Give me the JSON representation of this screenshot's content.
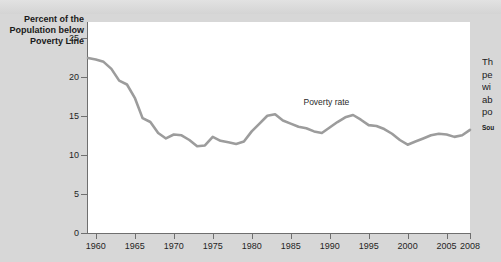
{
  "figure": {
    "y_axis_title": "Percent of the Population below Poverty Line",
    "series_annotation": "Poverty rate",
    "line_color": "#9c9c9c",
    "panel_color": "#ffffff",
    "background_color": "#d7d7d7"
  },
  "side_text": {
    "lines": [
      "Th",
      "pe",
      "wi",
      "ab",
      "po"
    ],
    "source_label": "Sou"
  },
  "chart_data": {
    "type": "line",
    "title": "",
    "xlabel": "",
    "ylabel": "Percent of the Population below Poverty Line",
    "xlim": [
      1959,
      2008
    ],
    "ylim": [
      0,
      27
    ],
    "grid": false,
    "legend": "none",
    "annotations": [
      {
        "text": "Poverty rate",
        "x": 1991,
        "y": 16.8
      }
    ],
    "ytick_labels": [
      "0",
      "5",
      "10",
      "15",
      "20",
      "25"
    ],
    "yticks": [
      0,
      5,
      10,
      15,
      20,
      25
    ],
    "xtick_labels": [
      "1960",
      "1965",
      "1970",
      "1975",
      "1980",
      "1985",
      "1990",
      "1995",
      "2000",
      "2005",
      "2008"
    ],
    "xticks": [
      1960,
      1965,
      1970,
      1975,
      1980,
      1985,
      1990,
      1995,
      2000,
      2005,
      2008
    ],
    "series": [
      {
        "name": "Poverty rate",
        "x": [
          1959,
          1960,
          1961,
          1962,
          1963,
          1964,
          1965,
          1966,
          1967,
          1968,
          1969,
          1970,
          1971,
          1972,
          1973,
          1974,
          1975,
          1976,
          1977,
          1978,
          1979,
          1980,
          1981,
          1982,
          1983,
          1984,
          1985,
          1986,
          1987,
          1988,
          1989,
          1990,
          1991,
          1992,
          1993,
          1994,
          1995,
          1996,
          1997,
          1998,
          1999,
          2000,
          2001,
          2002,
          2003,
          2004,
          2005,
          2006,
          2007,
          2008
        ],
        "values": [
          22.4,
          22.2,
          21.9,
          21.0,
          19.5,
          19.0,
          17.3,
          14.7,
          14.2,
          12.8,
          12.1,
          12.6,
          12.5,
          11.9,
          11.1,
          11.2,
          12.3,
          11.8,
          11.6,
          11.4,
          11.7,
          13.0,
          14.0,
          15.0,
          15.2,
          14.4,
          14.0,
          13.6,
          13.4,
          13.0,
          12.8,
          13.5,
          14.2,
          14.8,
          15.1,
          14.5,
          13.8,
          13.7,
          13.3,
          12.7,
          11.9,
          11.3,
          11.7,
          12.1,
          12.5,
          12.7,
          12.6,
          12.3,
          12.5,
          13.2
        ]
      }
    ]
  }
}
